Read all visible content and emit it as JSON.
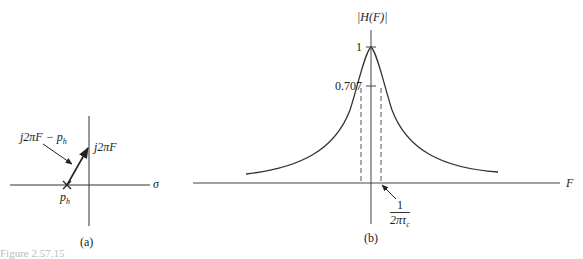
{
  "figure_a": {
    "label": "(a)",
    "sigma_label": "σ",
    "pole_label": "p",
    "pole_sub": "h",
    "vector_label": "j2πF − p",
    "vector_sub": "h",
    "point_label": "j2πF"
  },
  "figure_b": {
    "label": "(b)",
    "y_axis_label": "|H(F)|",
    "x_axis_label": "F",
    "tick_one": "1",
    "tick_707": "0.707",
    "cutoff_num": "1",
    "cutoff_den": "2πτ",
    "cutoff_den_sub": "c"
  },
  "caption": "Figure 2.57.15"
}
